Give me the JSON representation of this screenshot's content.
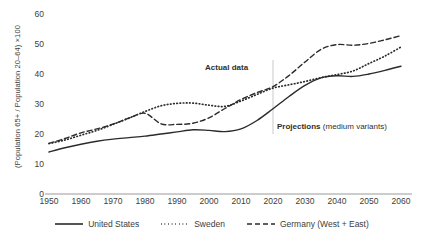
{
  "chart_data": {
    "type": "line",
    "title": "",
    "subtitle": "",
    "xlabel": "",
    "ylabel": "(Population 65+ / Population 20–64) ×100",
    "xlim": [
      1950,
      2060
    ],
    "ylim": [
      0,
      60
    ],
    "grid": false,
    "legend_position": "bottom",
    "x_ticks": [
      "1950",
      "1960",
      "1970",
      "1980",
      "1990",
      "2000",
      "2010",
      "2020",
      "2030",
      "2040",
      "2050",
      "2060"
    ],
    "y_ticks": [
      "0",
      "10",
      "20",
      "30",
      "40",
      "50",
      "60"
    ],
    "x": [
      1950,
      1955,
      1960,
      1965,
      1970,
      1975,
      1980,
      1985,
      1990,
      1995,
      2000,
      2005,
      2010,
      2015,
      2020,
      2025,
      2030,
      2035,
      2040,
      2045,
      2050,
      2055,
      2060
    ],
    "series": [
      {
        "name": "United States",
        "style": "solid",
        "color": "#2b2b2b",
        "values": [
          14.0,
          15.4,
          16.6,
          17.6,
          18.3,
          18.8,
          19.3,
          20.0,
          20.7,
          21.4,
          21.2,
          20.8,
          21.7,
          24.5,
          28.4,
          32.5,
          36.2,
          38.7,
          39.4,
          39.2,
          40.0,
          41.2,
          42.6
        ]
      },
      {
        "name": "Sweden",
        "style": "dotted",
        "color": "#2b2b2b",
        "values": [
          16.8,
          18.0,
          19.6,
          21.2,
          23.2,
          25.3,
          27.5,
          29.4,
          30.2,
          30.3,
          29.6,
          29.2,
          31.0,
          33.2,
          35.3,
          36.4,
          37.5,
          38.8,
          39.8,
          41.0,
          43.5,
          46.0,
          49.0
        ]
      },
      {
        "name": "Germany (West + East)",
        "style": "dashed",
        "color": "#2b2b2b",
        "values": [
          16.9,
          18.5,
          20.4,
          21.7,
          23.3,
          25.3,
          26.9,
          23.4,
          23.2,
          23.6,
          25.4,
          28.5,
          31.5,
          33.8,
          35.8,
          39.5,
          44.0,
          48.2,
          49.8,
          49.6,
          50.2,
          51.4,
          52.8
        ]
      }
    ],
    "annotations": [
      {
        "name": "actual-data",
        "text": "Actual data",
        "bold": true
      },
      {
        "name": "projections",
        "bold_text": "Projections",
        "text": " (medium variants)"
      }
    ],
    "divider_year": 2020
  },
  "axis": {
    "y_title": "(Population 65+ / Population 20–64) ×100",
    "y_ticks": [
      "60",
      "50",
      "40",
      "30",
      "20",
      "10",
      "0"
    ],
    "x_ticks": [
      "1950",
      "1960",
      "1970",
      "1980",
      "1990",
      "2000",
      "2010",
      "2020",
      "2030",
      "2040",
      "2050",
      "2060"
    ]
  },
  "annotations": {
    "actual_data": "Actual data",
    "projections_bold": "Projections",
    "projections_rest": " (medium variants)"
  },
  "legend": {
    "items": [
      {
        "label": "United States",
        "style": "solid"
      },
      {
        "label": "Sweden",
        "style": "dotted"
      },
      {
        "label": "Germany (West + East)",
        "style": "dashed"
      }
    ]
  },
  "colors": {
    "line": "#2b2b2b",
    "axis": "#9a9a9a",
    "text": "#3d3d3d",
    "divider": "#c9c9c9",
    "background": "#ffffff"
  }
}
